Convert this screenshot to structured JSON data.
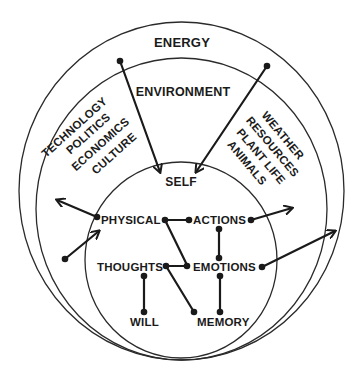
{
  "diagram": {
    "rings": {
      "outer": {
        "label": "ENERGY"
      },
      "middle": {
        "label": "ENVIRONMENT"
      },
      "inner": {
        "label": "SELF"
      }
    },
    "environment_left": {
      "lines": [
        "TECHNOLOGY",
        "POLITICS",
        "ECONOMICS",
        "CULTURE"
      ]
    },
    "environment_right": {
      "lines": [
        "WEATHER",
        "RESOURCES",
        "PLANT LIFE",
        "ANIMALS"
      ]
    },
    "self_nodes": {
      "physical": "PHYSICAL",
      "actions": "ACTIONS",
      "thoughts": "THOUGHTS",
      "emotions": "EMOTIONS",
      "will": "WILL",
      "memory": "MEMORY"
    },
    "connections": [
      {
        "from": "PHYSICAL",
        "to": "ACTIONS"
      },
      {
        "from": "PHYSICAL",
        "to": "EMOTIONS"
      },
      {
        "from": "THOUGHTS",
        "to": "EMOTIONS"
      },
      {
        "from": "THOUGHTS",
        "to": "MEMORY"
      },
      {
        "from": "ACTIONS",
        "to": "EMOTIONS"
      },
      {
        "from": "THOUGHTS",
        "to": "WILL"
      },
      {
        "from": "EMOTIONS",
        "to": "MEMORY"
      }
    ],
    "arrows": [
      {
        "from": "ENERGY",
        "to": "SELF"
      },
      {
        "from": "ENERGY",
        "to": "SELF"
      },
      {
        "from": "PHYSICAL",
        "to": "ENVIRONMENT"
      },
      {
        "from": "ENVIRONMENT",
        "to": "PHYSICAL"
      },
      {
        "from": "ACTIONS",
        "to": "ENVIRONMENT"
      },
      {
        "from": "EMOTIONS",
        "to": "ENERGY"
      }
    ],
    "colors": {
      "ink": "#1a1a1a",
      "background": "#ffffff"
    }
  }
}
